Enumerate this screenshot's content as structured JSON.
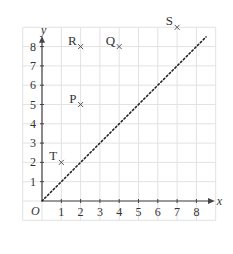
{
  "chart_data": {
    "type": "scatter",
    "title": "",
    "xlabel": "x",
    "ylabel": "y",
    "origin_label": "O",
    "xlim": [
      -1,
      9
    ],
    "ylim": [
      -1,
      9
    ],
    "x_ticks": [
      "1",
      "2",
      "3",
      "4",
      "5",
      "6",
      "7",
      "8"
    ],
    "y_ticks": [
      "1",
      "2",
      "3",
      "4",
      "5",
      "6",
      "7",
      "8"
    ],
    "grid": true,
    "points": [
      {
        "label": "R",
        "x": 2,
        "y": 8
      },
      {
        "label": "Q",
        "x": 4,
        "y": 8
      },
      {
        "label": "S",
        "x": 7,
        "y": 9
      },
      {
        "label": "P",
        "x": 2,
        "y": 5
      },
      {
        "label": "T",
        "x": 1,
        "y": 2
      }
    ],
    "lines": [
      {
        "name": "y = x",
        "style": "dotted",
        "from": [
          0,
          0
        ],
        "to": [
          8.5,
          8.5
        ]
      }
    ]
  },
  "colors": {
    "grid": "#e2e2e2",
    "axis": "#444444",
    "text": "#333333"
  }
}
